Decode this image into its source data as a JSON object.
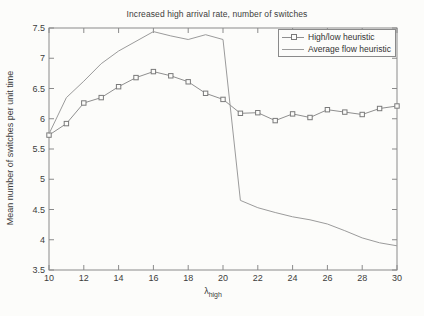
{
  "figure": {
    "background": "#fcfcfa"
  },
  "chart": {
    "title": "Increased high arrival rate, number of switches",
    "ylabel": "Mean number of switches per unit time",
    "xlabel_base": "λ",
    "xlabel_sub": "high"
  },
  "legend": {
    "items": [
      {
        "label": "High/low heuristic",
        "marker": "square"
      },
      {
        "label": "Average flow heuristic",
        "marker": "none"
      }
    ]
  },
  "colors": {
    "axis": "#8a8a8a",
    "tick_text": "#3c3c3c",
    "highlow_line": "#8f8f8f",
    "highlow_marker": "#7a7a7a",
    "avgflow_line": "#9b9b9b"
  },
  "chart_data": {
    "type": "line",
    "title": "Increased high arrival rate, number of switches",
    "xlabel": "λ_high",
    "ylabel": "Mean number of switches per unit time",
    "xlim": [
      10,
      30
    ],
    "ylim": [
      3.5,
      7.5
    ],
    "xticks": [
      10,
      12,
      14,
      16,
      18,
      20,
      22,
      24,
      26,
      28,
      30
    ],
    "yticks": [
      3.5,
      4,
      4.5,
      5,
      5.5,
      6,
      6.5,
      7,
      7.5
    ],
    "grid": false,
    "legend_position": "upper right",
    "x": [
      10,
      11,
      12,
      13,
      14,
      15,
      16,
      17,
      18,
      19,
      20,
      21,
      22,
      23,
      24,
      25,
      26,
      27,
      28,
      29,
      30
    ],
    "series": [
      {
        "name": "High/low heuristic",
        "marker": "square",
        "color": "#8f8f8f",
        "values": [
          5.73,
          5.92,
          6.26,
          6.35,
          6.53,
          6.68,
          6.78,
          6.71,
          6.61,
          6.42,
          6.32,
          6.09,
          6.1,
          5.97,
          6.08,
          6.02,
          6.15,
          6.11,
          6.07,
          6.17,
          6.21
        ]
      },
      {
        "name": "Average flow heuristic",
        "marker": "none",
        "color": "#9b9b9b",
        "values": [
          5.75,
          6.35,
          6.62,
          6.91,
          7.12,
          7.28,
          7.44,
          7.37,
          7.31,
          7.39,
          7.31,
          4.65,
          4.53,
          4.45,
          4.38,
          4.33,
          4.26,
          4.15,
          4.03,
          3.95,
          3.9
        ]
      }
    ]
  }
}
